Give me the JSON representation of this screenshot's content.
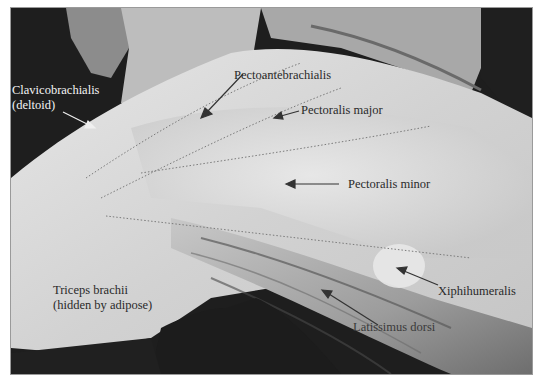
{
  "figure": {
    "labels": [
      {
        "id": "clavicobrachialis",
        "text": "Clavicobrachialis",
        "x": 11,
        "y": 82,
        "color": "light"
      },
      {
        "id": "clavicobrachialis-sub",
        "text": "(deltoid)",
        "x": 11,
        "y": 97,
        "color": "light"
      },
      {
        "id": "pectoantebrachialis",
        "text": "Pectoantebrachialis",
        "x": 233,
        "y": 67,
        "color": "dark"
      },
      {
        "id": "pectoralis-major",
        "text": "Pectoralis major",
        "x": 300,
        "y": 102,
        "color": "dark"
      },
      {
        "id": "pectoralis-minor",
        "text": "Pectoralis minor",
        "x": 347,
        "y": 176,
        "color": "dark"
      },
      {
        "id": "triceps",
        "text": "Triceps brachii",
        "x": 52,
        "y": 282,
        "color": "dark"
      },
      {
        "id": "triceps-sub",
        "text": "(hidden by adipose)",
        "x": 52,
        "y": 297,
        "color": "dark"
      },
      {
        "id": "xiphihumeralis",
        "text": "Xiphihumeralis",
        "x": 437,
        "y": 283,
        "color": "dark"
      },
      {
        "id": "latissimus-dorsi",
        "text": "Latissimus dorsi",
        "x": 352,
        "y": 319,
        "color": "dark"
      }
    ],
    "colors": {
      "frame_border": "#9a9a9a",
      "tissue_light": "#d8d8d8",
      "tissue_mid": "#b5b5b5",
      "background_dark": "#1e1e1e",
      "label_dark": "#2a2a2a",
      "label_light": "#f4f4f4",
      "arrow_dark": "#333333",
      "arrow_light": "#f0f0f0"
    }
  }
}
